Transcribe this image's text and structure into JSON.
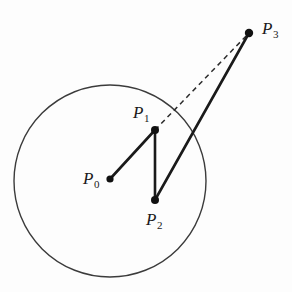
{
  "figure": {
    "background_color": "#fdfdfd",
    "stroke_color": "#1a1a1a",
    "circle_stroke_color": "#3b3b3b",
    "canvas": {
      "width": 292,
      "height": 292
    }
  },
  "labels": {
    "p0": {
      "base": "P",
      "sub": "0"
    },
    "p1": {
      "base": "P",
      "sub": "1"
    },
    "p2": {
      "base": "P",
      "sub": "2"
    },
    "p3": {
      "base": "P",
      "sub": "3"
    }
  },
  "chart_data": {
    "type": "scatter",
    "title": "",
    "xlabel": "",
    "ylabel": "",
    "xlim": [
      0,
      292
    ],
    "ylim": [
      292,
      0
    ],
    "grid": false,
    "legend": false,
    "points": [
      {
        "name": "P0",
        "label": "P₀",
        "x": 110,
        "y": 179,
        "marker": "filled-circle",
        "radius": 3.6,
        "role": "circle-center"
      },
      {
        "name": "P1",
        "label": "P₁",
        "x": 155,
        "y": 130,
        "marker": "filled-circle",
        "radius": 4.0,
        "role": "vertex"
      },
      {
        "name": "P2",
        "label": "P₂",
        "x": 155,
        "y": 200,
        "marker": "filled-circle",
        "radius": 4.0,
        "role": "vertex"
      },
      {
        "name": "P3",
        "label": "P₃",
        "x": 249,
        "y": 33,
        "marker": "filled-circle",
        "radius": 4.2,
        "role": "external-point"
      }
    ],
    "shapes": [
      {
        "name": "circle",
        "type": "circle",
        "cx": 110,
        "cy": 181,
        "r": 96,
        "stroke": "#3b3b3b",
        "stroke_width": 1.4,
        "fill": "none"
      }
    ],
    "segments": [
      {
        "name": "P0-P1",
        "from": "P0",
        "to": "P1",
        "x1": 110,
        "y1": 179,
        "x2": 155,
        "y2": 130,
        "style": "solid",
        "stroke_width": 2.6
      },
      {
        "name": "P1-P2",
        "from": "P1",
        "to": "P2",
        "x1": 155,
        "y1": 130,
        "x2": 155,
        "y2": 200,
        "style": "solid",
        "stroke_width": 2.6
      },
      {
        "name": "P2-P3",
        "from": "P2",
        "to": "P3",
        "x1": 155,
        "y1": 200,
        "x2": 249,
        "y2": 33,
        "style": "solid",
        "stroke_width": 2.6
      },
      {
        "name": "P1-P3",
        "from": "P1",
        "to": "P3",
        "x1": 155,
        "y1": 130,
        "x2": 249,
        "y2": 33,
        "style": "dashed",
        "stroke_width": 1.5,
        "dash_pattern": "5,4"
      }
    ],
    "label_positions": [
      {
        "for": "P0",
        "x": 93,
        "y": 179,
        "anchor": "left-of-point"
      },
      {
        "for": "P1",
        "x": 143,
        "y": 113,
        "anchor": "above-left-of-point"
      },
      {
        "for": "P2",
        "x": 157,
        "y": 221,
        "anchor": "below-point"
      },
      {
        "for": "P3",
        "x": 270,
        "y": 30,
        "anchor": "right-of-point"
      }
    ]
  }
}
